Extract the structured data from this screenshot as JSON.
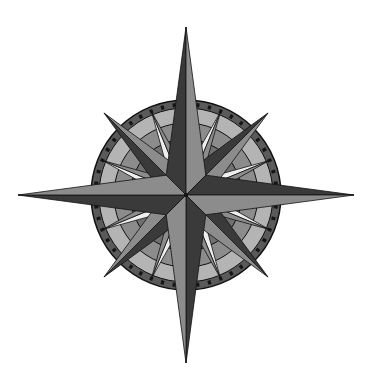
{
  "image": {
    "subject": "Compass rose",
    "description": "Sixteen-point grayscale compass rose with a tick-marked circular ring"
  },
  "compass": {
    "center": [
      186,
      195
    ],
    "cardinal_length": 168,
    "intercardinal_length": 116,
    "secondary_length": 90,
    "ring_outer_radius": 95,
    "ring_band_inner_radius": 87,
    "mid_band_inner_radius": 72,
    "inner_radius": 56,
    "tick_count": 48,
    "colors": {
      "dark": "#3a3a3a",
      "mid": "#8c8c8c",
      "light": "#b4b4b4",
      "white": "#eeeeee",
      "ring": "#5a5a5a",
      "inner": "#707070",
      "outline": "#111111",
      "background": "#ffffff"
    }
  }
}
